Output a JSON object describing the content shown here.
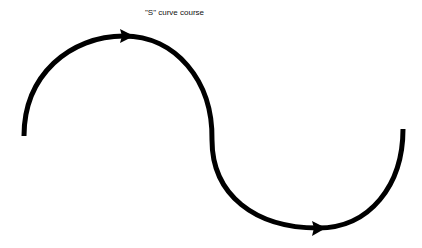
{
  "diagram": {
    "title": "\"S\" curve course",
    "stroke_color": "#000000",
    "background": "#ffffff",
    "path": {
      "start": [
        24,
        136
      ],
      "upper_apex": [
        124,
        36
      ],
      "inflection": [
        213,
        150
      ],
      "lower_apex": [
        318,
        228
      ],
      "end": [
        403,
        129
      ]
    },
    "arrows": [
      {
        "name": "upper-arrow",
        "position": [
          130,
          36
        ],
        "direction": "right"
      },
      {
        "name": "lower-arrow",
        "position": [
          321,
          228
        ],
        "direction": "right"
      }
    ]
  }
}
